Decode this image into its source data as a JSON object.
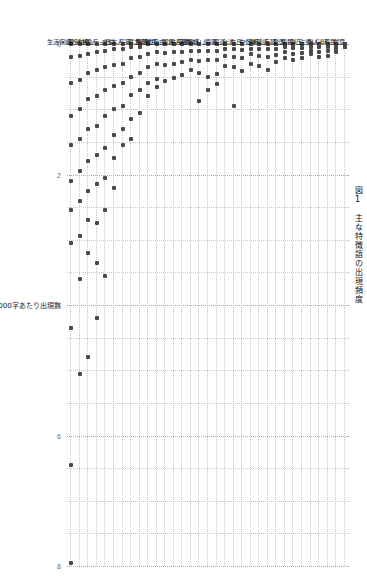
{
  "figure": {
    "caption": "図1　主な特徴語の出現頻度",
    "caption_number": "図1",
    "caption_title": "主な特徴語の出現頻度"
  },
  "chart_data": {
    "type": "scatter",
    "title": "図1　主な特徴語の出現頻度",
    "xlabel": "",
    "ylabel": "10000字あたり出現数",
    "orientation": "vertical-categories",
    "grid": true,
    "legend": null,
    "ylim": [
      0,
      8
    ],
    "yticks": [
      0,
      2,
      4,
      6,
      8
    ],
    "ytick_labels": [
      "0",
      "2",
      "4",
      "6",
      "8"
    ],
    "point_color": "#4a4a4a",
    "grid_color": "#c9c9c9",
    "categories": [
      "戯意",
      "移民",
      "LGBT",
      "外人",
      "占領",
      "弾圧",
      "情報",
      "愛国",
      "反韓",
      "嫌韓感",
      "デモ",
      "中傷",
      "在日",
      "台湾",
      "報道",
      "侮辱",
      "ムスリム",
      "人権擁護",
      "宗教",
      "秩序",
      "国籍",
      "表現の自由",
      "難民",
      "排除",
      "暴力",
      "平等",
      "日本人",
      "言論",
      "マイノリティ",
      "外国人",
      "人権",
      "差別",
      "生活保護"
    ],
    "series": [
      {
        "name": "文書別出現頻度",
        "points": [
          {
            "category": "戯意",
            "values": [
              0.0,
              0.0,
              0.0,
              0.05,
              0.05
            ]
          },
          {
            "category": "移民",
            "values": [
              0.0,
              0.0,
              0.05,
              0.08,
              0.12
            ]
          },
          {
            "category": "LGBT",
            "values": [
              0.0,
              0.0,
              0.05,
              0.1,
              0.18
            ]
          },
          {
            "category": "外人",
            "values": [
              0.0,
              0.0,
              0.05,
              0.12,
              0.2
            ]
          },
          {
            "category": "占領",
            "values": [
              0.0,
              0.0,
              0.05,
              0.1,
              0.16
            ]
          },
          {
            "category": "弾圧",
            "values": [
              0.0,
              0.0,
              0.06,
              0.14,
              0.22
            ]
          },
          {
            "category": "情報",
            "values": [
              0.0,
              0.0,
              0.06,
              0.15,
              0.24
            ]
          },
          {
            "category": "愛国",
            "values": [
              0.0,
              0.0,
              0.05,
              0.13,
              0.21
            ]
          },
          {
            "category": "反韓",
            "values": [
              0.0,
              0.0,
              0.07,
              0.17,
              0.28
            ]
          },
          {
            "category": "嫌韓感",
            "values": [
              0.0,
              0.0,
              0.08,
              0.2,
              0.4
            ]
          },
          {
            "category": "デモ",
            "values": [
              0.0,
              0.0,
              0.08,
              0.18,
              0.34
            ]
          },
          {
            "category": "中傷",
            "values": [
              0.0,
              0.0,
              0.07,
              0.16,
              0.3
            ]
          },
          {
            "category": "在日",
            "values": [
              0.0,
              0.0,
              0.09,
              0.22,
              0.42
            ]
          },
          {
            "category": "台湾",
            "values": [
              0.0,
              0.0,
              0.08,
              0.2,
              0.36,
              0.95
            ]
          },
          {
            "category": "報道",
            "values": [
              0.0,
              0.0,
              0.08,
              0.19,
              0.33
            ]
          },
          {
            "category": "侮辱",
            "values": [
              0.0,
              0.0,
              0.1,
              0.24,
              0.46,
              0.62
            ]
          },
          {
            "category": "ムスリム",
            "values": [
              0.0,
              0.0,
              0.1,
              0.25,
              0.5,
              0.7
            ]
          },
          {
            "category": "人権擁護",
            "values": [
              0.0,
              0.0,
              0.11,
              0.26,
              0.44,
              0.88
            ]
          },
          {
            "category": "宗教",
            "values": [
              0.0,
              0.0,
              0.1,
              0.24,
              0.4
            ]
          },
          {
            "category": "秩序",
            "values": [
              0.0,
              0.0,
              0.12,
              0.28,
              0.48
            ]
          },
          {
            "category": "国籍",
            "values": [
              0.0,
              0.0,
              0.13,
              0.3,
              0.52
            ]
          },
          {
            "category": "表現の自由",
            "values": [
              0.0,
              0.0,
              0.14,
              0.32,
              0.56
            ]
          },
          {
            "category": "難民",
            "values": [
              0.0,
              0.0,
              0.13,
              0.3,
              0.54,
              0.66
            ]
          },
          {
            "category": "排除",
            "values": [
              0.0,
              0.0,
              0.15,
              0.35,
              0.6,
              0.8
            ]
          },
          {
            "category": "暴力",
            "values": [
              0.0,
              0.05,
              0.2,
              0.45,
              0.7,
              1.05
            ]
          },
          {
            "category": "平等",
            "values": [
              0.0,
              0.05,
              0.22,
              0.5,
              0.78,
              1.15,
              1.45
            ]
          },
          {
            "category": "日本人",
            "values": [
              0.0,
              0.08,
              0.3,
              0.6,
              0.95,
              1.3,
              1.55
            ]
          },
          {
            "category": "言論",
            "values": [
              0.0,
              0.08,
              0.32,
              0.65,
              1.0,
              1.4,
              1.75,
              2.2
            ]
          },
          {
            "category": "マイノリティ",
            "values": [
              0.0,
              0.1,
              0.35,
              0.7,
              1.1,
              1.6,
              2.05,
              2.55,
              3.55
            ]
          },
          {
            "category": "外国人",
            "values": [
              0.0,
              0.12,
              0.4,
              0.8,
              1.25,
              1.7,
              2.15,
              2.75,
              3.35,
              4.2
            ]
          },
          {
            "category": "人権",
            "values": [
              0.0,
              0.15,
              0.45,
              0.85,
              1.3,
              1.8,
              2.25,
              2.7,
              3.2,
              4.8
            ]
          },
          {
            "category": "差別",
            "values": [
              0.0,
              0.18,
              0.55,
              1.0,
              1.45,
              1.95,
              2.4,
              2.95,
              3.6,
              5.05
            ]
          },
          {
            "category": "生活保護",
            "values": [
              0.0,
              0.2,
              0.6,
              1.1,
              1.55,
              2.1,
              2.55,
              3.05,
              4.35,
              6.45,
              7.95
            ]
          }
        ]
      }
    ]
  }
}
